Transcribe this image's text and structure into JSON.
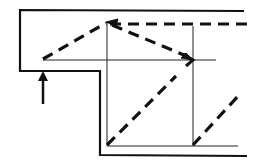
{
  "diagram": {
    "colors": {
      "line": "#111111",
      "background": "#ffffff"
    },
    "elements": {
      "outer_wall": "outer-wall",
      "guide_lines": "guide-lines",
      "ray_paths": "ray-paths",
      "incident_arrow": "incident-arrow"
    }
  }
}
